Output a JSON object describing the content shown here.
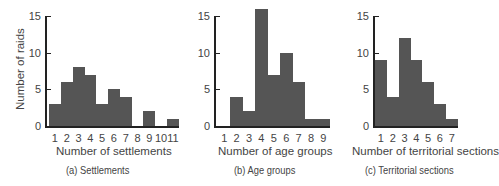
{
  "chart_data": [
    {
      "type": "bar",
      "title": "(a) Settlements",
      "xlabel": "Number of settlements",
      "ylabel": "Number of raids",
      "categories": [
        "1",
        "2",
        "3",
        "4",
        "5",
        "6",
        "7",
        "8",
        "9",
        "10",
        "11"
      ],
      "values": [
        3,
        6,
        8,
        7,
        3,
        5,
        4,
        0,
        2,
        0,
        1
      ],
      "ylim": [
        0,
        15
      ],
      "yticks": [
        0,
        5,
        10,
        15
      ],
      "grid": false,
      "bar_color": "#555555"
    },
    {
      "type": "bar",
      "title": "(b) Age groups",
      "xlabel": "Number of age groups",
      "ylabel": "",
      "categories": [
        "1",
        "2",
        "3",
        "4",
        "5",
        "6",
        "7",
        "8",
        "9"
      ],
      "values": [
        0,
        4,
        2,
        16,
        7,
        10,
        6,
        1,
        1
      ],
      "ylim": [
        0,
        15
      ],
      "yticks": [
        0,
        5,
        10,
        15
      ],
      "grid": false,
      "bar_color": "#555555"
    },
    {
      "type": "bar",
      "title": "(c) Territorial sections",
      "xlabel": "Number of territorial sections",
      "ylabel": "",
      "categories": [
        "1",
        "2",
        "3",
        "4",
        "5",
        "6",
        "7"
      ],
      "values": [
        9,
        4,
        12,
        9,
        6,
        3,
        1
      ],
      "ylim": [
        0,
        15
      ],
      "yticks": [
        0,
        5,
        10,
        15
      ],
      "grid": false,
      "bar_color": "#555555"
    }
  ]
}
